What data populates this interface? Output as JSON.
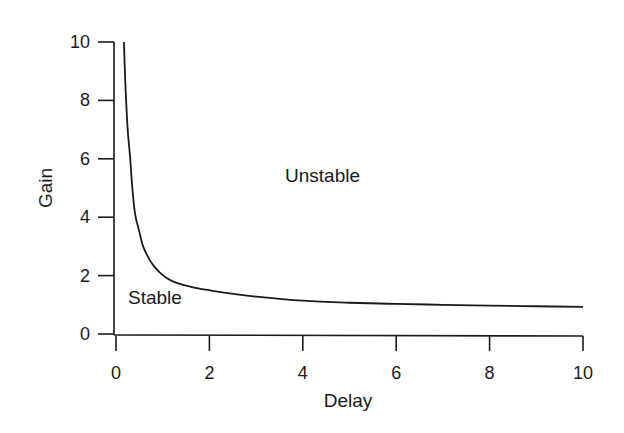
{
  "chart_data": {
    "type": "line",
    "title": "",
    "xlabel": "Delay",
    "ylabel": "Gain",
    "xlim": [
      0,
      10
    ],
    "ylim": [
      0,
      10
    ],
    "x_ticks": [
      0,
      2,
      4,
      6,
      8,
      10
    ],
    "y_ticks": [
      0,
      2,
      4,
      6,
      8,
      10
    ],
    "grid": false,
    "legend": null,
    "annotations": [
      {
        "text": "Unstable",
        "x": 5.4,
        "y": 5.8
      },
      {
        "text": "Stable",
        "x": 0.9,
        "y": 1.2
      }
    ],
    "series": [
      {
        "name": "Stability boundary",
        "x": [
          0.17,
          0.2,
          0.25,
          0.3,
          0.35,
          0.41,
          0.5,
          0.58,
          0.7,
          0.8,
          0.94,
          1.1,
          1.3,
          1.65,
          2.0,
          2.4,
          3.0,
          4.0,
          5.0,
          6.0,
          7.0,
          8.0,
          9.0,
          10.0
        ],
        "y": [
          10.0,
          8.6,
          7.0,
          6.1,
          5.0,
          4.1,
          3.5,
          3.0,
          2.6,
          2.35,
          2.1,
          1.9,
          1.75,
          1.6,
          1.5,
          1.4,
          1.28,
          1.14,
          1.07,
          1.03,
          1.0,
          0.97,
          0.95,
          0.93
        ]
      }
    ]
  }
}
